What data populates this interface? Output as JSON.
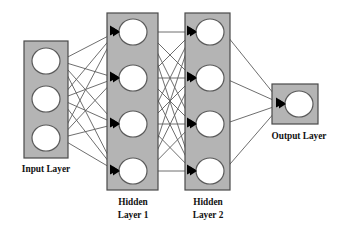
{
  "diagram": {
    "type": "feedforward-neural-network",
    "background_color": "#ffffff",
    "box_fill_color": "#b4b4b4",
    "box_stroke_color": "#4a4a4a",
    "node_fill_color": "#ffffff",
    "node_stroke_color": "#5a5a5a",
    "edge_color": "#5e5e5e",
    "arrow_color": "#000000",
    "label_color": "#111111"
  },
  "labels": {
    "input": "Input Layer",
    "hidden1_line1": "Hidden",
    "hidden1_line2": "Layer 1",
    "hidden2_line1": "Hidden",
    "hidden2_line2": "Layer 2",
    "output": "Output Layer"
  },
  "layers": [
    {
      "id": "input",
      "name": "Input Layer",
      "node_count": 3,
      "box": {
        "x": 24,
        "y": 41,
        "w": 44,
        "h": 117
      },
      "nodes": [
        {
          "cx": 46,
          "cy": 61,
          "r": 14
        },
        {
          "cx": 46,
          "cy": 99,
          "r": 14
        },
        {
          "cx": 46,
          "cy": 138,
          "r": 14
        }
      ],
      "label_pos": {
        "x": 46,
        "y": 172
      }
    },
    {
      "id": "hidden1",
      "name": "Hidden Layer 1",
      "node_count": 4,
      "box": {
        "x": 107,
        "y": 13,
        "w": 51,
        "h": 177
      },
      "nodes": [
        {
          "cx": 133,
          "cy": 32,
          "r": 14
        },
        {
          "cx": 133,
          "cy": 78,
          "r": 14
        },
        {
          "cx": 133,
          "cy": 124,
          "r": 14
        },
        {
          "cx": 133,
          "cy": 171,
          "r": 14
        }
      ],
      "label_pos": {
        "x": 133,
        "y": 205
      }
    },
    {
      "id": "hidden2",
      "name": "Hidden Layer 2",
      "node_count": 4,
      "box": {
        "x": 185,
        "y": 13,
        "w": 45,
        "h": 177
      },
      "nodes": [
        {
          "cx": 210,
          "cy": 32,
          "r": 14
        },
        {
          "cx": 210,
          "cy": 78,
          "r": 14
        },
        {
          "cx": 210,
          "cy": 124,
          "r": 14
        },
        {
          "cx": 210,
          "cy": 171,
          "r": 14
        }
      ],
      "label_pos": {
        "x": 208,
        "y": 205
      }
    },
    {
      "id": "output",
      "name": "Output Layer",
      "node_count": 1,
      "box": {
        "x": 272,
        "y": 84,
        "w": 46,
        "h": 40
      },
      "nodes": [
        {
          "cx": 299,
          "cy": 104,
          "r": 14
        }
      ],
      "label_pos": {
        "x": 299,
        "y": 139
      }
    }
  ],
  "connections": [
    {
      "from": "input",
      "to": "hidden1",
      "pattern": "fully-connected",
      "count": 12
    },
    {
      "from": "hidden1",
      "to": "hidden2",
      "pattern": "fully-connected",
      "count": 16
    },
    {
      "from": "hidden2",
      "to": "output",
      "pattern": "fully-connected",
      "count": 4
    }
  ]
}
